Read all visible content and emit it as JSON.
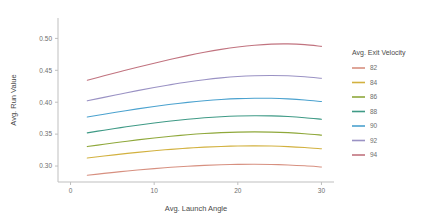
{
  "chart_data": {
    "type": "line",
    "title": "",
    "subtitle": "",
    "xlabel": "Avg. Launch Angle",
    "ylabel": "Avg. Run Value",
    "xlim": [
      -1.5,
      31.5
    ],
    "ylim": [
      0.275,
      0.532
    ],
    "xticks": [
      0,
      10,
      20,
      30
    ],
    "xtick_labels": [
      "0",
      "10",
      "20",
      "30"
    ],
    "yticks": [
      0.3,
      0.35,
      0.4,
      0.45,
      0.5
    ],
    "ytick_labels": [
      "0.30",
      "0.35",
      "0.40",
      "0.45",
      "0.50"
    ],
    "grid": false,
    "legend_position": "right",
    "legend_title": "Avg. Exit Velocity",
    "x": [
      2,
      4,
      6,
      8,
      10,
      12,
      14,
      16,
      18,
      20,
      22,
      24,
      26,
      28,
      30
    ],
    "series": [
      {
        "name": "82",
        "color": "#d79080",
        "values": [
          0.2855,
          0.2885,
          0.2912,
          0.2937,
          0.296,
          0.298,
          0.2996,
          0.301,
          0.302,
          0.3026,
          0.3028,
          0.3025,
          0.3017,
          0.3004,
          0.2986
        ]
      },
      {
        "name": "84",
        "color": "#d2b13f",
        "values": [
          0.3125,
          0.3157,
          0.3187,
          0.3215,
          0.324,
          0.3262,
          0.3281,
          0.3296,
          0.3307,
          0.3314,
          0.3316,
          0.3313,
          0.3305,
          0.3291,
          0.3272
        ]
      },
      {
        "name": "86",
        "color": "#8fa83b",
        "values": [
          0.3305,
          0.3342,
          0.3377,
          0.341,
          0.344,
          0.3467,
          0.349,
          0.3509,
          0.3523,
          0.3532,
          0.3535,
          0.3532,
          0.3523,
          0.3507,
          0.3485
        ]
      },
      {
        "name": "88",
        "color": "#3f9a86",
        "values": [
          0.352,
          0.3562,
          0.3602,
          0.364,
          0.3675,
          0.3706,
          0.3733,
          0.3756,
          0.3773,
          0.3784,
          0.3789,
          0.3786,
          0.3776,
          0.3758,
          0.3733
        ]
      },
      {
        "name": "90",
        "color": "#4ba2cf",
        "values": [
          0.3768,
          0.3812,
          0.3855,
          0.3896,
          0.3934,
          0.3968,
          0.3998,
          0.4023,
          0.4043,
          0.4057,
          0.4063,
          0.4062,
          0.4053,
          0.4036,
          0.4011
        ]
      },
      {
        "name": "92",
        "color": "#9a92c4",
        "values": [
          0.4022,
          0.4076,
          0.413,
          0.4182,
          0.4231,
          0.4276,
          0.4317,
          0.4352,
          0.4381,
          0.4403,
          0.4416,
          0.442,
          0.4415,
          0.44,
          0.4375
        ]
      },
      {
        "name": "94",
        "color": "#c1737f",
        "values": [
          0.4345,
          0.4414,
          0.4482,
          0.4548,
          0.4612,
          0.4673,
          0.473,
          0.4782,
          0.4828,
          0.4866,
          0.4894,
          0.4911,
          0.4914,
          0.4903,
          0.4876
        ]
      }
    ]
  },
  "axes": {
    "x_title": "Avg. Launch Angle",
    "y_title": "Avg. Run Value"
  },
  "legend": {
    "title": "Avg. Exit Velocity",
    "items": [
      {
        "label": "82",
        "color": "#d79080"
      },
      {
        "label": "84",
        "color": "#d2b13f"
      },
      {
        "label": "86",
        "color": "#8fa83b"
      },
      {
        "label": "88",
        "color": "#3f9a86"
      },
      {
        "label": "90",
        "color": "#4ba2cf"
      },
      {
        "label": "92",
        "color": "#9a92c4"
      },
      {
        "label": "94",
        "color": "#c1737f"
      }
    ]
  },
  "theme": {
    "background": "#ffffff",
    "axis_color": "#bfbfbf",
    "tick_text_color": "#6e6e6e",
    "title_text_color": "#4a4a4a"
  }
}
